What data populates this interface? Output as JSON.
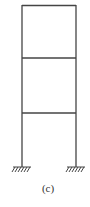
{
  "diagram": {
    "type": "three-story single-bay frame with fixed supports",
    "caption": "(c)",
    "stroke_color": "#444444",
    "columns": [
      {
        "name": "left-column",
        "x": 22,
        "y_top": 5,
        "y_bottom": 167
      },
      {
        "name": "right-column",
        "x": 76,
        "y_top": 5,
        "y_bottom": 167
      }
    ],
    "beams": [
      {
        "name": "roof-beam",
        "y": 5
      },
      {
        "name": "second-floor-beam",
        "y": 58
      },
      {
        "name": "first-floor-beam",
        "y": 113
      }
    ],
    "supports": [
      {
        "name": "left-fixed-support",
        "x": 22,
        "y": 167,
        "type": "fixed"
      },
      {
        "name": "right-fixed-support",
        "x": 76,
        "y": 167,
        "type": "fixed"
      }
    ]
  }
}
